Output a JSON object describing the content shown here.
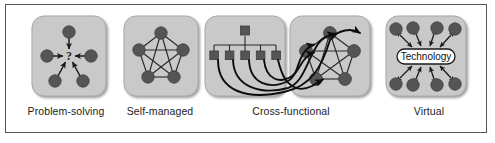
{
  "figure": {
    "background_color": "#ffffff",
    "border_color": "#58585a"
  },
  "style": {
    "panel_fill": "#c9c9c9",
    "panel_stroke": "#a8a8a8",
    "node_fill": "#555555",
    "node_stroke": "#3a3a3a",
    "link_color": "#2b2b2b",
    "arrow_color": "#0d0d0d",
    "pill_fill": "#ffffff",
    "pill_stroke": "#1b1b1b",
    "label_color": "#1b1b1b"
  },
  "panels": [
    {
      "id": "problem-solving",
      "caption": "Problem-solving",
      "description": "Five member nodes with arrows converging on a central question mark",
      "center_symbol": "?",
      "node_count": 5,
      "arrow_style": "inward-single"
    },
    {
      "id": "self-managed",
      "caption": "Self-managed",
      "description": "Five member nodes fully interconnected in a pentagon (complete graph)",
      "node_count": 5,
      "edge_count": 10,
      "arrow_style": "undirected"
    },
    {
      "id": "cross-functional",
      "caption": "Cross-functional",
      "description": "A hierarchy of squares on the left linked by long curved arrows to an interconnected pentagon network on the right",
      "hierarchy": {
        "parent_count": 1,
        "child_count": 5,
        "node_shape": "square"
      },
      "network": {
        "node_count": 5,
        "edge_count": 10,
        "node_shape": "circle"
      },
      "arrow_style": "curved-directed",
      "curved_arrow_count": 5
    },
    {
      "id": "virtual",
      "caption": "Virtual",
      "description": "Eight member nodes, four above and four below, exchanging double-headed arrows with a central Technology hub",
      "node_count": 8,
      "hub_label": "Technology",
      "arrow_style": "double-headed"
    }
  ]
}
